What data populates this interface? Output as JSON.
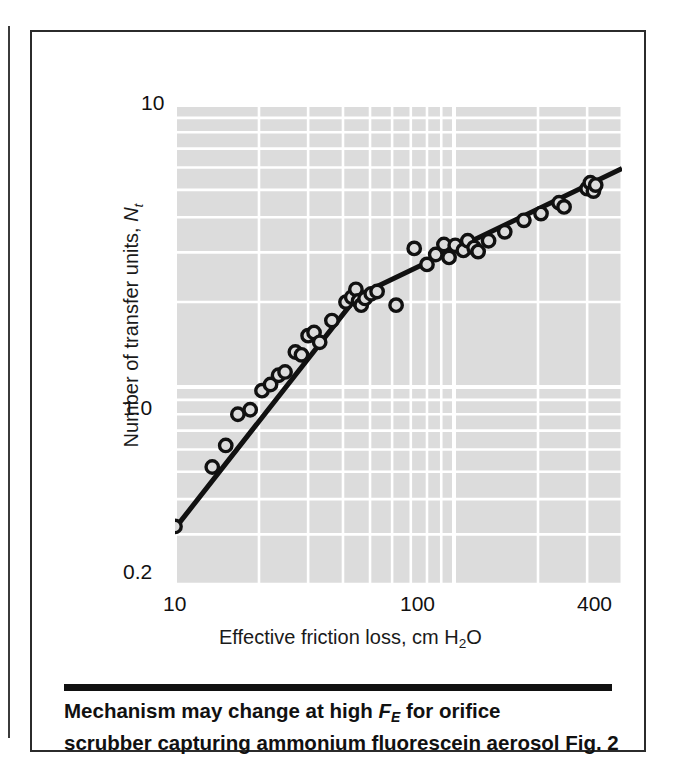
{
  "figure": {
    "caption_line_1_pre": "Mechanism may change at high ",
    "caption_line_1_sym": "F",
    "caption_line_1_sub": "E",
    "caption_line_1_post": " for orifice",
    "caption_line_2": "scrubber capturing ammonium fluorescein aerosol Fig. 2",
    "figure_number": "Fig. 2"
  },
  "chart_data": {
    "type": "scatter",
    "title": "",
    "xlabel_pre": "Effective friction loss, cm H",
    "xlabel_sub": "2",
    "xlabel_post": "O",
    "xlabel": "Effective friction loss, cm H2O",
    "ylabel_pre": "Number of transfer units, ",
    "ylabel_sym": "N",
    "ylabel_sub": "t",
    "ylabel": "Number of transfer units, Nt",
    "xscale": "log",
    "yscale": "log",
    "xlim": [
      10,
      400
    ],
    "ylim": [
      0.2,
      10
    ],
    "xticks": [
      10,
      100,
      400
    ],
    "xtick_labels": [
      "10",
      "100",
      "400"
    ],
    "yticks": [
      0.2,
      1.0,
      10
    ],
    "ytick_labels": [
      "0.2",
      "1.0",
      "10"
    ],
    "grid": true,
    "grid_color": "#ffffff",
    "plot_background": "#dcdcdc",
    "marker": "open-circle",
    "marker_color": "#111111",
    "line_color": "#111111",
    "legend": "none",
    "points": [
      [
        10.0,
        0.32
      ],
      [
        13.6,
        0.52
      ],
      [
        15.2,
        0.62
      ],
      [
        16.8,
        0.8
      ],
      [
        18.6,
        0.83
      ],
      [
        20.5,
        0.97
      ],
      [
        22.0,
        1.02
      ],
      [
        23.5,
        1.1
      ],
      [
        24.8,
        1.13
      ],
      [
        27.0,
        1.33
      ],
      [
        28.4,
        1.3
      ],
      [
        30.0,
        1.52
      ],
      [
        31.5,
        1.56
      ],
      [
        33.0,
        1.44
      ],
      [
        36.5,
        1.72
      ],
      [
        41.0,
        2.0
      ],
      [
        43.0,
        2.08
      ],
      [
        44.5,
        2.22
      ],
      [
        45.5,
        2.02
      ],
      [
        46.5,
        1.95
      ],
      [
        48.0,
        2.06
      ],
      [
        50.5,
        2.14
      ],
      [
        53.0,
        2.18
      ],
      [
        62.0,
        1.95
      ],
      [
        72.0,
        3.1
      ],
      [
        80.0,
        2.72
      ],
      [
        86.0,
        2.95
      ],
      [
        92.0,
        3.2
      ],
      [
        96.0,
        2.88
      ],
      [
        101.0,
        3.18
      ],
      [
        108.0,
        3.05
      ],
      [
        112.0,
        3.3
      ],
      [
        118.0,
        3.12
      ],
      [
        122.0,
        3.02
      ],
      [
        133.0,
        3.3
      ],
      [
        152.0,
        3.55
      ],
      [
        178.0,
        3.9
      ],
      [
        205.0,
        4.12
      ],
      [
        238.0,
        4.5
      ],
      [
        248.0,
        4.35
      ],
      [
        300.0,
        5.05
      ],
      [
        308.0,
        5.3
      ],
      [
        316.0,
        4.95
      ],
      [
        322.0,
        5.2
      ]
    ],
    "fit_line": {
      "description": "two-segment fit with slope break",
      "vertices": [
        [
          10.0,
          0.315
        ],
        [
          45.0,
          2.1
        ],
        [
          400.0,
          5.95
        ]
      ]
    },
    "annotations": []
  }
}
